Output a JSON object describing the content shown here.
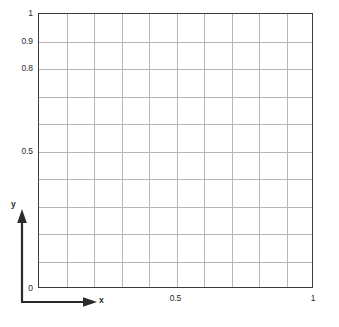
{
  "chart_data": {
    "type": "line",
    "title": "",
    "xlabel": "x",
    "ylabel": "y",
    "xlim": [
      0,
      1
    ],
    "ylim": [
      0,
      1
    ],
    "grid": true,
    "grid_divisions_x": 10,
    "grid_divisions_y": 10,
    "legend": "none",
    "series": [],
    "x_ticks": [
      {
        "value": 0.5,
        "label": "0.5"
      },
      {
        "value": 1.0,
        "label": "1"
      }
    ],
    "y_ticks": [
      {
        "value": 1.0,
        "label": "1"
      },
      {
        "value": 0.9,
        "label": "0.9"
      },
      {
        "value": 0.8,
        "label": "0.8"
      },
      {
        "value": 0.5,
        "label": "0.5"
      },
      {
        "value": 0.0,
        "label": "0"
      }
    ]
  },
  "axes": {
    "x_axis_name": "x",
    "y_axis_name": "y",
    "x_arrow_icon": "arrow-right-icon",
    "y_arrow_icon": "arrow-up-icon"
  },
  "colors": {
    "frame": "#3c3c3c",
    "grid": "#b6b6b6",
    "text": "#2b2b2b",
    "background": "#ffffff"
  }
}
